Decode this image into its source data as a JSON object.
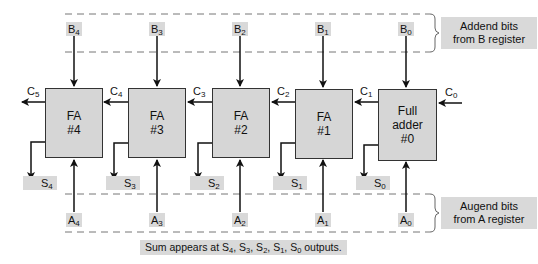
{
  "diagram": {
    "type": "parallel-binary-adder",
    "stages": [
      {
        "id": "fa4",
        "line1": "FA",
        "line2": "#4",
        "line3": "",
        "b": "B",
        "b_sub": "4",
        "a": "A",
        "a_sub": "4",
        "s": "S",
        "s_sub": "4",
        "cout": "C",
        "cout_sub": "5"
      },
      {
        "id": "fa3",
        "line1": "FA",
        "line2": "#3",
        "line3": "",
        "b": "B",
        "b_sub": "3",
        "a": "A",
        "a_sub": "3",
        "s": "S",
        "s_sub": "3",
        "cout": "C",
        "cout_sub": "4"
      },
      {
        "id": "fa2",
        "line1": "FA",
        "line2": "#2",
        "line3": "",
        "b": "B",
        "b_sub": "2",
        "a": "A",
        "a_sub": "2",
        "s": "S",
        "s_sub": "2",
        "cout": "C",
        "cout_sub": "3"
      },
      {
        "id": "fa1",
        "line1": "FA",
        "line2": "#1",
        "line3": "",
        "b": "B",
        "b_sub": "1",
        "a": "A",
        "a_sub": "1",
        "s": "S",
        "s_sub": "1",
        "cout": "C",
        "cout_sub": "2"
      },
      {
        "id": "fa0",
        "line1": "Full",
        "line2": "adder",
        "line3": "#0",
        "b": "B",
        "b_sub": "0",
        "a": "A",
        "a_sub": "0",
        "s": "S",
        "s_sub": "0",
        "cout": "C",
        "cout_sub": "1"
      }
    ],
    "carry_in": {
      "label": "C",
      "sub": "0"
    },
    "addend_note": {
      "line1": "Addend bits",
      "line2": "from B register"
    },
    "augend_note": {
      "line1": "Augend bits",
      "line2": "from A register"
    },
    "sum_note": {
      "prefix": "Sum appears at ",
      "terms": [
        {
          "l": "S",
          "s": "4"
        },
        {
          "l": "S",
          "s": "3"
        },
        {
          "l": "S",
          "s": "2"
        },
        {
          "l": "S",
          "s": "1"
        },
        {
          "l": "S",
          "s": "0"
        }
      ],
      "suffix": " outputs."
    },
    "colors": {
      "box_fill": "#d6d6d6",
      "label_fill": "#d9d9d9",
      "line": "#111111",
      "dash": "#777777"
    }
  }
}
